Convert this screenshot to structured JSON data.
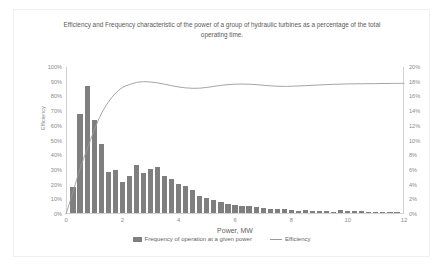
{
  "chart_data": {
    "type": "bar",
    "title": "Efficiency and Frequency characteristic of the power of a group of hydraulic turbines as a percentage of the total operating time.",
    "xlabel": "Power, MW",
    "ylabel": "Efficiency",
    "ylabel_secondary": "Duration of work as a percentage of the total time",
    "xlim": [
      0,
      12
    ],
    "ylim": [
      0,
      100
    ],
    "ylim_secondary": [
      0,
      20
    ],
    "grid": false,
    "legend_position": "bottom",
    "xticks": [
      "0",
      "2",
      "4",
      "6",
      "8",
      "10",
      "12"
    ],
    "xtick_values": [
      0,
      2,
      4,
      6,
      8,
      10,
      12
    ],
    "yticks": [
      "0%",
      "10%",
      "20%",
      "30%",
      "40%",
      "50%",
      "60%",
      "70%",
      "80%",
      "90%",
      "100%"
    ],
    "ytick_values": [
      0,
      10,
      20,
      30,
      40,
      50,
      60,
      70,
      80,
      90,
      100
    ],
    "yticks_secondary": [
      "0%",
      "2%",
      "4%",
      "6%",
      "8%",
      "10%",
      "12%",
      "14%",
      "16%",
      "18%",
      "20%"
    ],
    "ytick_secondary_values": [
      0,
      2,
      4,
      6,
      8,
      10,
      12,
      14,
      16,
      18,
      20
    ],
    "series": [
      {
        "name": "Frequency of operation at a given power",
        "type": "bar",
        "axis": "secondary",
        "color": "#7f7f7f",
        "x": [
          0.25,
          0.5,
          0.75,
          1.0,
          1.25,
          1.5,
          1.75,
          2.0,
          2.25,
          2.5,
          2.75,
          3.0,
          3.25,
          3.5,
          3.75,
          4.0,
          4.25,
          4.5,
          4.75,
          5.0,
          5.25,
          5.5,
          5.75,
          6.0,
          6.25,
          6.5,
          6.75,
          7.0,
          7.25,
          7.5,
          7.75,
          8.0,
          8.25,
          8.5,
          8.75,
          9.0,
          9.25,
          9.5,
          9.75,
          10.0,
          10.25,
          10.5,
          10.75,
          11.0,
          11.25,
          11.5,
          11.75
        ],
        "values": [
          3.6,
          13.6,
          17.4,
          12.8,
          9.4,
          5.6,
          5.9,
          4.3,
          5.1,
          6.6,
          5.5,
          6.0,
          6.3,
          5.1,
          4.7,
          4.0,
          3.7,
          3.1,
          2.3,
          2.1,
          1.8,
          1.5,
          1.3,
          1.1,
          1.0,
          0.9,
          0.8,
          0.7,
          0.6,
          0.55,
          0.5,
          0.45,
          0.3,
          0.4,
          0.3,
          0.3,
          0.25,
          0.2,
          0.4,
          0.3,
          0.3,
          0.25,
          0.2,
          0.15,
          0.15,
          0.1,
          0.1
        ]
      },
      {
        "name": "Efficiency",
        "type": "line",
        "axis": "primary",
        "color": "#9a9a9a",
        "x": [
          0.0,
          0.25,
          0.5,
          0.75,
          1.0,
          1.25,
          1.5,
          1.75,
          2.0,
          2.25,
          2.5,
          2.75,
          3.0,
          3.25,
          3.5,
          3.75,
          4.0,
          4.25,
          4.5,
          4.75,
          5.0,
          5.25,
          5.5,
          5.75,
          6.0,
          6.25,
          6.5,
          6.75,
          7.0,
          7.25,
          7.5,
          7.75,
          8.0,
          8.5,
          9.0,
          9.5,
          10.0,
          10.5,
          11.0,
          11.5,
          12.0
        ],
        "values": [
          0,
          15,
          31,
          44,
          57,
          68,
          76,
          82,
          86,
          88,
          89.5,
          90,
          89.8,
          89.2,
          88.3,
          87.3,
          86.4,
          85.8,
          85.5,
          85.6,
          86.1,
          86.8,
          87.5,
          88.0,
          88.3,
          88.4,
          88.3,
          88.0,
          87.6,
          87.2,
          86.9,
          86.8,
          86.9,
          87.3,
          87.8,
          88.2,
          88.5,
          88.6,
          88.7,
          88.8,
          88.9
        ]
      }
    ],
    "legend": [
      "Frequency of operation at a given power",
      "Efficiency"
    ]
  }
}
